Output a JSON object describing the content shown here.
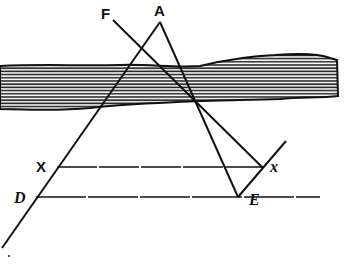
{
  "diagram": {
    "type": "geometry-figure",
    "labels": {
      "F": "F",
      "A": "A",
      "X": "X",
      "D": "D",
      "x": "x",
      "E": "E"
    },
    "colors": {
      "ink": "#111111",
      "background": "#ffffff"
    }
  }
}
